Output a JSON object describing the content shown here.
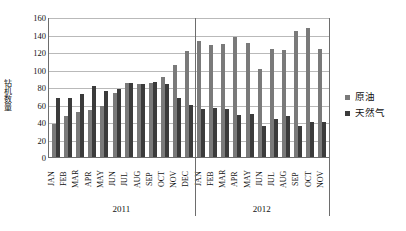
{
  "chart_data": {
    "type": "bar",
    "title": "",
    "xlabel": "",
    "ylabel": "钻机数量",
    "ylim": [
      0,
      160
    ],
    "yticks": [
      0,
      20,
      40,
      60,
      80,
      100,
      120,
      140,
      160
    ],
    "grid": true,
    "legend_position": "right",
    "categories": [
      "JAN",
      "FEB",
      "MAR",
      "APR",
      "MAY",
      "JUN",
      "JUL",
      "AUG",
      "SEP",
      "OCT",
      "NOV",
      "DEC",
      "JAN",
      "FEB",
      "MAR",
      "APR",
      "MAY",
      "JUN",
      "JUL",
      "AUG",
      "SEP",
      "OCT",
      "NOV"
    ],
    "groups": [
      {
        "label": "2011",
        "count": 12
      },
      {
        "label": "2012",
        "count": 11
      }
    ],
    "series": [
      {
        "name": "原油",
        "color": "#7a7a7a",
        "values": [
          38,
          47,
          51,
          54,
          58,
          73,
          85,
          83,
          85,
          92,
          105,
          121,
          133,
          128,
          129,
          137,
          130,
          101,
          124,
          122,
          144,
          147,
          124
        ]
      },
      {
        "name": "天然气",
        "color": "#3b3b3b",
        "values": [
          68,
          67,
          72,
          81,
          75,
          78,
          85,
          83,
          86,
          84,
          68,
          59,
          55,
          56,
          55,
          48,
          49,
          36,
          44,
          47,
          35,
          40,
          40
        ]
      }
    ]
  },
  "legend": {
    "items": [
      {
        "label": "原油"
      },
      {
        "label": "天然气"
      }
    ]
  }
}
